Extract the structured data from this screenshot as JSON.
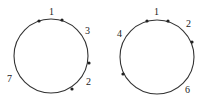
{
  "diagrams": [
    {
      "circle": {
        "cx": 51,
        "cy": 56,
        "r": 37
      },
      "dots": [
        {
          "x": 39,
          "y": 21
        },
        {
          "x": 62,
          "y": 20
        },
        {
          "x": 89,
          "y": 63
        },
        {
          "x": 72,
          "y": 89
        }
      ],
      "labels": [
        {
          "text": "1",
          "x": 49,
          "y": 15
        },
        {
          "text": "3",
          "x": 85,
          "y": 34
        },
        {
          "text": "2",
          "x": 86,
          "y": 85
        },
        {
          "text": "7",
          "x": 7,
          "y": 82
        }
      ]
    },
    {
      "circle": {
        "cx": 157,
        "cy": 57,
        "r": 37
      },
      "dots": [
        {
          "x": 147,
          "y": 21
        },
        {
          "x": 168,
          "y": 21
        },
        {
          "x": 192,
          "y": 42
        },
        {
          "x": 123,
          "y": 74
        }
      ],
      "labels": [
        {
          "text": "1",
          "x": 154,
          "y": 15
        },
        {
          "text": "2",
          "x": 186,
          "y": 27
        },
        {
          "text": "4",
          "x": 117,
          "y": 37
        },
        {
          "text": "6",
          "x": 185,
          "y": 93
        }
      ]
    }
  ],
  "colors": {
    "stroke": "#333333",
    "dot": "#222222"
  }
}
